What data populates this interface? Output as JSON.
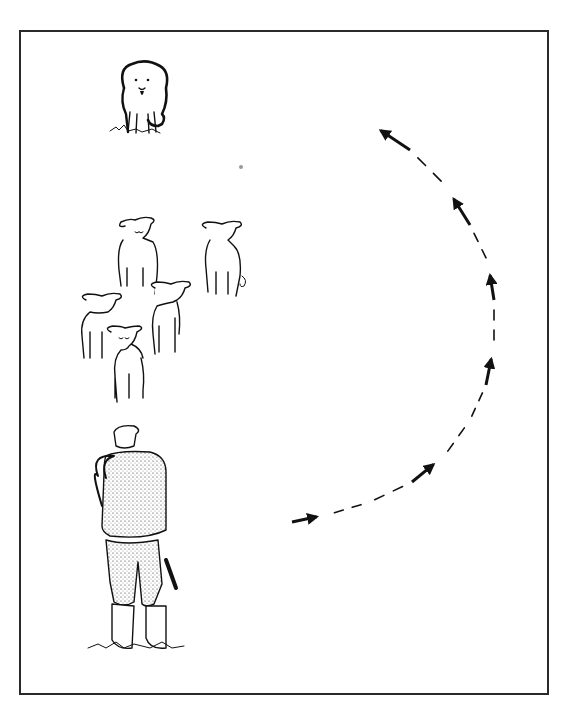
{
  "diagram": {
    "title": "",
    "elements": [
      {
        "id": "dog",
        "label": "sheepdog"
      },
      {
        "id": "flock",
        "label": "sheep",
        "count": 5
      },
      {
        "id": "shepherd",
        "label": "shepherd with crook"
      },
      {
        "id": "path",
        "label": "dog outrun path",
        "style": "dashed arc with arrows",
        "direction": "clockwise from shepherd around right side to behind flock",
        "arrow_count": 6
      }
    ]
  },
  "colors": {
    "ink": "#111111",
    "background": "#ffffff",
    "frame": "#2a2a2a"
  }
}
